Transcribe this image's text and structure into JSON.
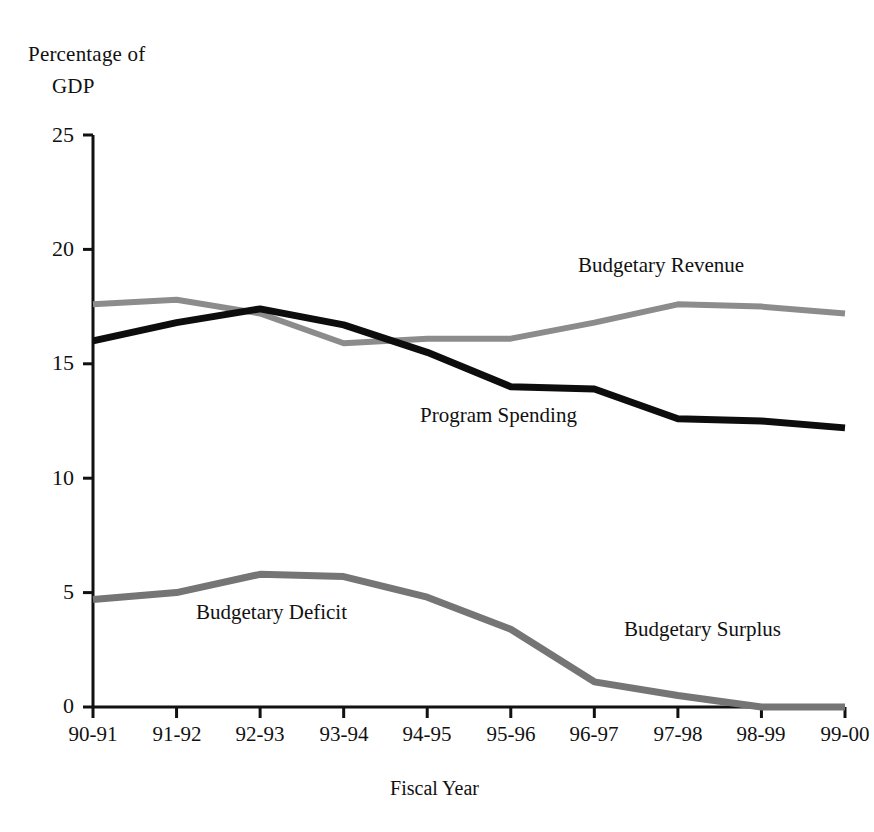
{
  "chart_data": {
    "type": "line",
    "title": "Percentage of GDP",
    "title_lines": [
      "Percentage of",
      "GDP"
    ],
    "xlabel": "Fiscal Year",
    "ylabel": "Percentage of GDP",
    "categories": [
      "90-91",
      "91-92",
      "92-93",
      "93-94",
      "94-95",
      "95-96",
      "96-97",
      "97-98",
      "98-99",
      "99-00"
    ],
    "ylim": [
      0,
      25
    ],
    "yticks": [
      0,
      5,
      10,
      15,
      20,
      25
    ],
    "grid": false,
    "legend": "inline-annotations",
    "series": [
      {
        "name": "Budgetary Revenue",
        "color": "#8c8c8c",
        "values": [
          17.6,
          17.8,
          17.2,
          15.9,
          16.1,
          16.1,
          16.8,
          17.6,
          17.5,
          17.2
        ]
      },
      {
        "name": "Program Spending",
        "color": "#0d0d0d",
        "values": [
          16.0,
          16.8,
          17.4,
          16.7,
          15.5,
          14.0,
          13.9,
          12.6,
          12.5,
          12.2
        ]
      },
      {
        "name": "Budgetary Deficit",
        "color": "#757575",
        "values": [
          4.7,
          5.0,
          5.8,
          5.7,
          4.8,
          3.4,
          1.1,
          0.5,
          0.0,
          0.0
        ],
        "note": "Same line is labelled Budgetary Surplus at the right end"
      }
    ],
    "annotations": [
      {
        "text": "Budgetary Revenue",
        "x_px": 578,
        "y_px": 253
      },
      {
        "text": "Program Spending",
        "x_px": 420,
        "y_px": 403
      },
      {
        "text": "Budgetary Deficit",
        "x_px": 196,
        "y_px": 600
      },
      {
        "text": "Budgetary Surplus",
        "x_px": 624,
        "y_px": 617
      }
    ]
  },
  "axes": {
    "y_tick_labels": [
      "25",
      "20",
      "15",
      "10",
      "5",
      "0"
    ],
    "x_tick_labels": [
      "90-91",
      "91-92",
      "92-93",
      "93-94",
      "94-95",
      "95-96",
      "96-97",
      "97-98",
      "98-99",
      "99-00"
    ]
  }
}
